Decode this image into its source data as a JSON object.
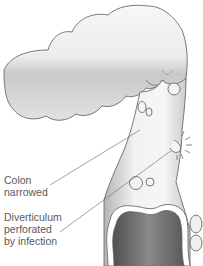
{
  "diagram": {
    "labels": [
      {
        "id": "colon-narrowed",
        "lines": [
          "Colon",
          "narrowed"
        ]
      },
      {
        "id": "diverticulum-perforated",
        "lines": [
          "Diverticulum",
          "perforated",
          "by infection"
        ]
      }
    ],
    "colors": {
      "outline": "#6b6b6b",
      "tissue_light": "#f4f4f4",
      "tissue_dark": "#b8b8b8",
      "lumen": "#6e6e6e",
      "leader_line": "#7a7a7a",
      "text": "#5a5a5a"
    }
  }
}
